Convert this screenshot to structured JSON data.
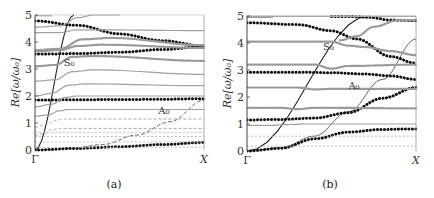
{
  "chart_data": [
    {
      "panel": "a",
      "type": "line",
      "caption": "(a)",
      "ylabel": "Re[ω/ω₀]",
      "xticks": [
        "Γ",
        "X"
      ],
      "yticks": [
        "0",
        "1",
        "2",
        "3",
        "4",
        "5"
      ],
      "ylim": [
        0,
        5
      ],
      "xlim": [
        0,
        1
      ],
      "annotations": [
        {
          "text": "S₀",
          "x": 0.17,
          "y": 3.1
        },
        {
          "text": "A₀",
          "x": 0.73,
          "y": 1.35
        }
      ],
      "series": [
        {
          "name": "S0 (plate mode)",
          "style": "solid-black",
          "x": [
            0,
            0.23
          ],
          "y": [
            0,
            5.0
          ]
        },
        {
          "name": "A0 (plate mode)",
          "style": "dashed-gray",
          "x": [
            0,
            0.2,
            0.4,
            0.6,
            0.8,
            1.0
          ],
          "y": [
            0,
            0.05,
            0.2,
            0.55,
            1.05,
            1.85
          ]
        },
        {
          "name": "black-dotted-1",
          "style": "black-dots",
          "x": [
            0,
            0.25,
            0.5,
            0.75,
            1.0
          ],
          "y": [
            0.0,
            0.06,
            0.12,
            0.2,
            0.28
          ]
        },
        {
          "name": "black-dotted-2",
          "style": "black-dots",
          "x": [
            0,
            0.25,
            0.5,
            0.75,
            1.0
          ],
          "y": [
            1.85,
            1.86,
            1.87,
            1.88,
            1.9
          ]
        },
        {
          "name": "black-dotted-3",
          "style": "black-dots",
          "x": [
            0,
            0.25,
            0.5,
            0.75,
            1.0
          ],
          "y": [
            3.55,
            3.57,
            3.62,
            3.72,
            3.83
          ]
        },
        {
          "name": "black-dotted-4",
          "style": "black-dots",
          "x": [
            0,
            0.25,
            0.5,
            0.75,
            1.0
          ],
          "y": [
            4.78,
            4.62,
            4.3,
            4.05,
            3.85
          ]
        },
        {
          "name": "gray-flat-0.1",
          "style": "gray-dashed-thin",
          "x": [
            0,
            1
          ],
          "y": [
            0.1,
            0.1
          ]
        },
        {
          "name": "gray-flat-0.3",
          "style": "gray-dashed-thin",
          "x": [
            0,
            1
          ],
          "y": [
            0.3,
            0.3
          ]
        },
        {
          "name": "gray-flat-0.5",
          "style": "gray-dashed-thin",
          "x": [
            0,
            1
          ],
          "y": [
            0.5,
            0.5
          ]
        },
        {
          "name": "gray-flat-0.65",
          "style": "gray-dashed-thin",
          "x": [
            0,
            1
          ],
          "y": [
            0.65,
            0.65
          ]
        },
        {
          "name": "gray-curve-0.8",
          "style": "gray-dashed",
          "x": [
            0,
            0.05,
            0.1,
            0.15,
            1.0
          ],
          "y": [
            0.55,
            0.6,
            0.75,
            0.8,
            0.8
          ]
        },
        {
          "name": "gray-curve-1.15",
          "style": "gray-dashed",
          "x": [
            0,
            0.07,
            0.12,
            0.17,
            1.0
          ],
          "y": [
            0.85,
            0.95,
            1.1,
            1.15,
            1.15
          ]
        },
        {
          "name": "gray-curve-1.5",
          "style": "gray-solid",
          "x": [
            0,
            0.08,
            0.14,
            0.2,
            1.0
          ],
          "y": [
            1.25,
            1.3,
            1.45,
            1.5,
            1.5
          ]
        },
        {
          "name": "gray-curve-2.0",
          "style": "gray-solid",
          "x": [
            0,
            0.1,
            0.18,
            0.25,
            1.0
          ],
          "y": [
            1.6,
            1.7,
            1.95,
            2.0,
            2.0
          ]
        },
        {
          "name": "gray-curve-2.45",
          "style": "gray-solid",
          "x": [
            0,
            0.1,
            0.2,
            0.3,
            1.0
          ],
          "y": [
            2.0,
            2.1,
            2.4,
            2.45,
            2.38
          ]
        },
        {
          "name": "gray-curve-2.95",
          "style": "gray-solid",
          "x": [
            0,
            0.12,
            0.22,
            0.35,
            1.0
          ],
          "y": [
            2.55,
            2.6,
            2.9,
            2.97,
            2.8
          ]
        },
        {
          "name": "gray-curve-3.45",
          "style": "gray-dots",
          "x": [
            0,
            0.12,
            0.22,
            0.35,
            1.0
          ],
          "y": [
            3.1,
            3.15,
            3.45,
            3.48,
            3.3
          ]
        },
        {
          "name": "gray-curve-3.8",
          "style": "gray-dots",
          "x": [
            0,
            0.15,
            0.25,
            0.4,
            1.0
          ],
          "y": [
            3.65,
            3.7,
            3.85,
            3.9,
            3.78
          ]
        },
        {
          "name": "gray-curve-4.15",
          "style": "gray-dots",
          "x": [
            0,
            0.15,
            0.28,
            0.45,
            1.0
          ],
          "y": [
            3.7,
            3.75,
            4.1,
            4.15,
            3.88
          ]
        },
        {
          "name": "gray-curve-4.4",
          "style": "gray-solid",
          "x": [
            0,
            0.15,
            0.25,
            0.4,
            1.0
          ],
          "y": [
            4.35,
            4.35,
            4.45,
            4.45,
            4.42
          ]
        },
        {
          "name": "gray-curve-5.0",
          "style": "gray-solid",
          "x": [
            0,
            0.15,
            0.25,
            0.35,
            0.5
          ],
          "y": [
            4.55,
            4.6,
            4.9,
            5.0,
            5.0
          ]
        },
        {
          "name": "gray-top-5",
          "style": "gray-solid",
          "x": [
            0,
            0.1
          ],
          "y": [
            4.97,
            4.97
          ]
        }
      ]
    },
    {
      "panel": "b",
      "type": "line",
      "caption": "(b)",
      "ylabel": "Re[ω/ω₀]",
      "xticks": [
        "Γ",
        "X"
      ],
      "yticks": [
        "0",
        "1",
        "2",
        "3",
        "4",
        "5"
      ],
      "ylim": [
        0,
        5
      ],
      "xlim": [
        0,
        1
      ],
      "annotations": [
        {
          "text": "S₀",
          "x": 0.45,
          "y": 3.75
        },
        {
          "text": "A₀",
          "x": 0.6,
          "y": 2.3
        }
      ],
      "series": [
        {
          "name": "S0 (plate mode)",
          "style": "solid-black",
          "x": [
            0,
            0.72
          ],
          "y": [
            0,
            5.0
          ]
        },
        {
          "name": "A0 (plate mode)",
          "style": "solid-gray",
          "x": [
            0,
            0.2,
            0.4,
            0.6,
            0.8,
            1.0
          ],
          "y": [
            0,
            0.12,
            0.55,
            1.45,
            2.65,
            4.15
          ]
        },
        {
          "name": "black-dotted-1",
          "style": "black-dots",
          "x": [
            0,
            0.2,
            0.4,
            0.6,
            0.8,
            1.0
          ],
          "y": [
            0.0,
            0.1,
            0.45,
            0.7,
            0.8,
            0.82
          ]
        },
        {
          "name": "black-dotted-2",
          "style": "black-dots",
          "x": [
            0,
            0.2,
            0.4,
            0.6,
            0.8,
            1.0
          ],
          "y": [
            1.15,
            1.17,
            1.22,
            1.42,
            1.95,
            2.35
          ]
        },
        {
          "name": "black-dotted-3",
          "style": "black-dots",
          "x": [
            0,
            0.3,
            0.5,
            0.7,
            0.85,
            1.0
          ],
          "y": [
            2.92,
            2.92,
            2.9,
            2.85,
            2.78,
            2.65
          ]
        },
        {
          "name": "black-dotted-4",
          "style": "black-dots",
          "x": [
            0,
            0.3,
            0.5,
            0.65,
            0.85,
            1.0
          ],
          "y": [
            4.75,
            4.68,
            4.45,
            4.15,
            3.5,
            3.25
          ]
        },
        {
          "name": "black-dotted-5",
          "style": "black-dots",
          "x": [
            0.5,
            0.62,
            0.72,
            0.85,
            1.0
          ],
          "y": [
            4.98,
            4.98,
            4.95,
            4.85,
            4.83
          ]
        },
        {
          "name": "gray-flat-0.2",
          "style": "gray-dashed-thin",
          "x": [
            0,
            1
          ],
          "y": [
            0.18,
            0.18
          ]
        },
        {
          "name": "gray-flat-0.55",
          "style": "gray-dashed-thin",
          "x": [
            0,
            1
          ],
          "y": [
            0.55,
            0.55
          ]
        },
        {
          "name": "gray-curve-1.0",
          "style": "gray-solid",
          "x": [
            0,
            0.15,
            0.25,
            0.35,
            1.0
          ],
          "y": [
            0.95,
            0.95,
            0.98,
            1.0,
            1.0
          ]
        },
        {
          "name": "gray-curve-1.6",
          "style": "gray-dots",
          "x": [
            0,
            0.2,
            0.3,
            0.4,
            1.0
          ],
          "y": [
            1.6,
            1.6,
            1.55,
            1.6,
            1.58
          ]
        },
        {
          "name": "gray-curve-2.35",
          "style": "gray-dots",
          "x": [
            0,
            0.3,
            0.4,
            0.5,
            1.0
          ],
          "y": [
            2.35,
            2.35,
            2.28,
            2.3,
            2.3
          ]
        },
        {
          "name": "gray-curve-3.2",
          "style": "gray-dots",
          "x": [
            0,
            0.4,
            0.5,
            0.6,
            1.0
          ],
          "y": [
            3.2,
            3.2,
            3.05,
            3.15,
            3.2
          ]
        },
        {
          "name": "gray-curve-4.05",
          "style": "gray-dots",
          "x": [
            0,
            0.5,
            0.6,
            0.7,
            0.85,
            1.0
          ],
          "y": [
            4.05,
            4.05,
            3.9,
            3.85,
            3.7,
            3.55
          ]
        },
        {
          "name": "gray-curve-4.7",
          "style": "gray-dots",
          "x": [
            0.55,
            0.65,
            0.75,
            0.9,
            1.0
          ],
          "y": [
            4.1,
            4.25,
            4.6,
            4.85,
            4.85
          ]
        },
        {
          "name": "gray-top-5",
          "style": "gray-dots",
          "x": [
            0,
            0.15
          ],
          "y": [
            4.97,
            4.97
          ]
        },
        {
          "name": "gray-line-5",
          "style": "gray-solid",
          "x": [
            0,
            1
          ],
          "y": [
            4.99,
            4.99
          ]
        }
      ]
    }
  ],
  "panels": {
    "a": {
      "caption": "(a)",
      "ylabel": "Re[ω/ω₀]",
      "x_start": "Γ",
      "x_end": "X",
      "s0": "S₀",
      "a0": "A₀"
    },
    "b": {
      "caption": "(b)",
      "ylabel": "Re[ω/ω₀]",
      "x_start": "Γ",
      "x_end": "X",
      "s0": "S₀",
      "a0": "A₀"
    }
  }
}
